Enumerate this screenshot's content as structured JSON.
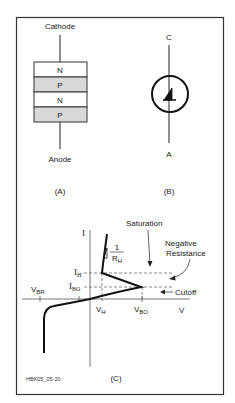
{
  "figure": {
    "id_label": "HBK05_05-20",
    "panel_a": {
      "caption": "(A)",
      "top_terminal": "Cathode",
      "bottom_terminal": "Anode",
      "layers": [
        {
          "label": "N",
          "fill": "#ffffff"
        },
        {
          "label": "P",
          "fill": "#d9d9d9"
        },
        {
          "label": "N",
          "fill": "#ffffff"
        },
        {
          "label": "P",
          "fill": "#d9d9d9"
        }
      ]
    },
    "panel_b": {
      "caption": "(B)",
      "top_terminal": "C",
      "bottom_terminal": "A"
    },
    "panel_c": {
      "caption": "(C)",
      "y_axis": "I",
      "x_axis": "V",
      "labels": {
        "ih": "I",
        "ih_sub": "H",
        "ibo": "I",
        "ibo_sub": "BO",
        "vbr": "V",
        "vbr_sub": "BR",
        "vh": "V",
        "vh_sub": "H",
        "vbo": "V",
        "vbo_sub": "BO",
        "slope_num": "1",
        "slope_den": "R",
        "slope_den_sub": "H"
      },
      "annotations": {
        "saturation": "Saturation",
        "negative_resistance_1": "Negative",
        "negative_resistance_2": "Resistance",
        "cutoff": "Cutoff"
      }
    }
  }
}
